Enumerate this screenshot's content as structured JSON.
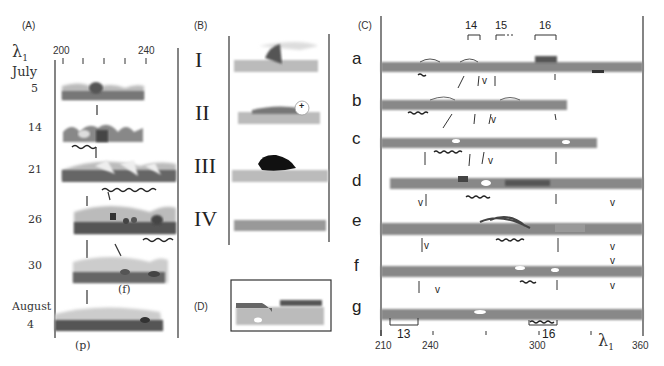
{
  "panels": {
    "A": {
      "label": "(A)",
      "axis_symbol": "λ",
      "axis_subscript": "1",
      "axis_ticks": [
        "200",
        "240"
      ],
      "month_start": "July",
      "dates": [
        "5",
        "14",
        "21",
        "26",
        "30"
      ],
      "month_end": "August",
      "last_date": "4",
      "annotations": [
        "(f)",
        "(p)"
      ]
    },
    "B": {
      "label": "(B)",
      "stages": [
        "I",
        "II",
        "III",
        "IV"
      ],
      "plus_marker": "+"
    },
    "C": {
      "label": "(C)",
      "rows": [
        "a",
        "b",
        "c",
        "d",
        "e",
        "f",
        "g"
      ],
      "top_brackets": [
        "14",
        "15",
        "16"
      ],
      "bottom_brackets": [
        "13",
        "16"
      ],
      "v_marker": "v",
      "axis_ticks": [
        "210",
        "240",
        "300",
        "360"
      ],
      "axis_symbol": "λ",
      "axis_subscript": "1"
    },
    "D": {
      "label": "(D)"
    }
  }
}
